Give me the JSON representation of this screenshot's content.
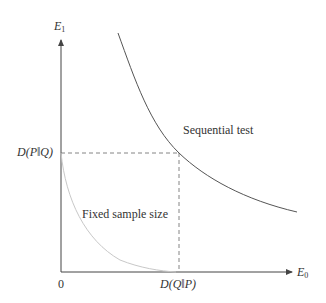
{
  "diagram": {
    "axes": {
      "y_label": "E",
      "y_label_sub": "1",
      "x_label": "E",
      "x_label_sub": "0",
      "origin_label": "0"
    },
    "markers": {
      "y_tick_label": "D(P‖Q)",
      "x_tick_label": "D(Q‖P)"
    },
    "curves": [
      {
        "name": "Sequential test",
        "label": "Sequential test",
        "color": "#555555"
      },
      {
        "name": "Fixed sample size",
        "label": "Fixed sample size",
        "color": "#c8c8c8"
      }
    ],
    "colors": {
      "axis": "#444444",
      "dashed": "#666666",
      "text": "#333333"
    }
  }
}
